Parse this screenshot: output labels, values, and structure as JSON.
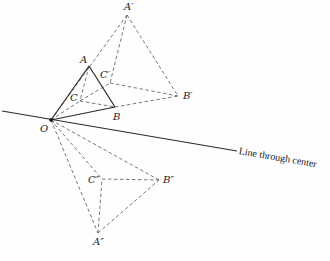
{
  "diagram": {
    "type": "geometric-construction",
    "line_label": "Line through center",
    "colors": {
      "solid": "#2a2a2a",
      "dashed": "#555555",
      "background": "#fefefe"
    },
    "points": {
      "O": {
        "label": "O",
        "x": 51,
        "y": 120,
        "lx": 40,
        "ly": 124
      },
      "A": {
        "label": "A",
        "x": 89,
        "y": 66,
        "lx": 80,
        "ly": 55
      },
      "B": {
        "label": "B",
        "x": 115,
        "y": 107,
        "lx": 113,
        "ly": 112
      },
      "C": {
        "label": "C",
        "x": 80,
        "y": 101,
        "lx": 70,
        "ly": 93
      },
      "A1": {
        "label": "A′",
        "x": 127,
        "y": 15,
        "lx": 124,
        "ly": 2
      },
      "B1": {
        "label": "B′",
        "x": 178,
        "y": 96,
        "lx": 183,
        "ly": 91
      },
      "C1": {
        "label": "C′",
        "x": 110,
        "y": 83,
        "lx": 100,
        "ly": 70
      },
      "A2": {
        "label": "A″",
        "x": 98,
        "y": 233,
        "lx": 93,
        "ly": 237
      },
      "B2": {
        "label": "B″",
        "x": 159,
        "y": 180,
        "lx": 163,
        "ly": 175
      },
      "C2": {
        "label": "C″",
        "x": 102,
        "y": 179,
        "lx": 88,
        "ly": 175
      }
    },
    "center_line": {
      "x1": 2,
      "y1": 111,
      "x2": 237,
      "y2": 151
    },
    "solid_segments": [
      [
        "O",
        "A"
      ],
      [
        "A",
        "B"
      ],
      [
        "O",
        "B"
      ]
    ],
    "dashed_segments": [
      [
        "A",
        "C"
      ],
      [
        "C",
        "B"
      ],
      [
        "O",
        "C"
      ],
      [
        "O",
        "A1"
      ],
      [
        "A1",
        "B1"
      ],
      [
        "A1",
        "C1"
      ],
      [
        "C1",
        "B1"
      ],
      [
        "B",
        "B1"
      ],
      [
        "C",
        "C1"
      ],
      [
        "O",
        "A2"
      ],
      [
        "O",
        "C2"
      ],
      [
        "O",
        "B2"
      ],
      [
        "A2",
        "B2"
      ],
      [
        "A2",
        "C2"
      ],
      [
        "C2",
        "B2"
      ]
    ]
  }
}
